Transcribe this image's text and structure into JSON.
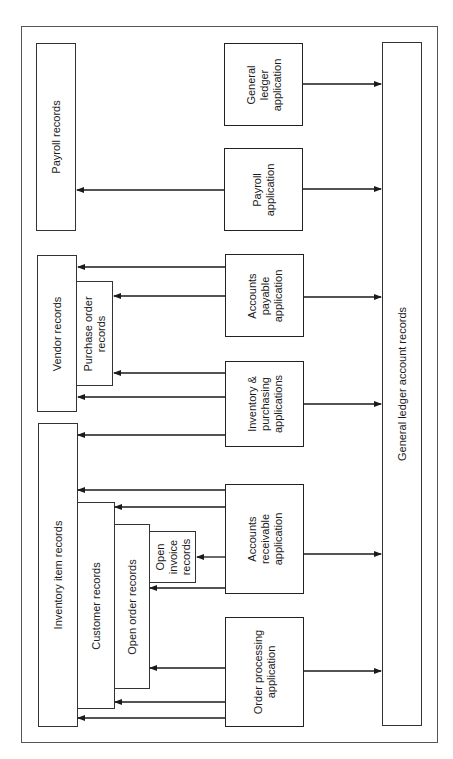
{
  "diagram": {
    "orientation": "rotated 90 degrees counter-clockwise",
    "records": [
      {
        "id": "payroll_records",
        "label": "Payroll records"
      },
      {
        "id": "vendor_records",
        "label": "Vendor records"
      },
      {
        "id": "purchase_order_records",
        "label": "Purchase order\nrecords"
      },
      {
        "id": "inventory_item_records",
        "label": "Inventory item records"
      },
      {
        "id": "customer_records",
        "label": "Customer records"
      },
      {
        "id": "open_order_records",
        "label": "Open order records"
      },
      {
        "id": "open_invoice_records",
        "label": "Open\ninvoice\nrecords"
      },
      {
        "id": "general_ledger_account_records",
        "label": "General ledger account records"
      }
    ],
    "applications": [
      {
        "id": "general_ledger_application",
        "label": "General\nledger\napplication"
      },
      {
        "id": "payroll_application",
        "label": "Payroll\napplication"
      },
      {
        "id": "accounts_payable_application",
        "label": "Accounts\npayable\napplication"
      },
      {
        "id": "inventory_purchasing_applications",
        "label": "Inventory &\npurchasing\napplications"
      },
      {
        "id": "accounts_receivable_application",
        "label": "Accounts\nreceivable\napplication"
      },
      {
        "id": "order_processing_application",
        "label": "Order processing\napplication"
      }
    ],
    "connections": [
      {
        "from": "general_ledger_application",
        "to": "general_ledger_account_records"
      },
      {
        "from": "payroll_application",
        "to": "payroll_records"
      },
      {
        "from": "payroll_application",
        "to": "general_ledger_account_records"
      },
      {
        "from": "accounts_payable_application",
        "to": "vendor_records"
      },
      {
        "from": "accounts_payable_application",
        "to": "purchase_order_records"
      },
      {
        "from": "accounts_payable_application",
        "to": "general_ledger_account_records"
      },
      {
        "from": "inventory_purchasing_applications",
        "to": "purchase_order_records"
      },
      {
        "from": "inventory_purchasing_applications",
        "to": "vendor_records"
      },
      {
        "from": "inventory_purchasing_applications",
        "to": "inventory_item_records"
      },
      {
        "from": "inventory_purchasing_applications",
        "to": "general_ledger_account_records"
      },
      {
        "from": "accounts_receivable_application",
        "to": "inventory_item_records"
      },
      {
        "from": "accounts_receivable_application",
        "to": "customer_records"
      },
      {
        "from": "accounts_receivable_application",
        "to": "open_invoice_records"
      },
      {
        "from": "accounts_receivable_application",
        "to": "open_order_records"
      },
      {
        "from": "accounts_receivable_application",
        "to": "general_ledger_account_records"
      },
      {
        "from": "order_processing_application",
        "to": "open_order_records"
      },
      {
        "from": "order_processing_application",
        "to": "customer_records"
      },
      {
        "from": "order_processing_application",
        "to": "inventory_item_records"
      },
      {
        "from": "order_processing_application",
        "to": "general_ledger_account_records"
      }
    ]
  }
}
